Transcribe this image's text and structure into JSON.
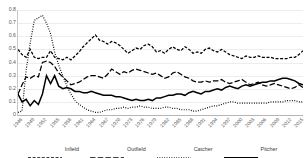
{
  "chart_data": {
    "type": "line",
    "title": "",
    "xlabel": "",
    "ylabel": "",
    "ylim": [
      0,
      0.8
    ],
    "ytick_labels": [
      "0.8",
      "0.7",
      "0.6",
      "0.5",
      "0.4",
      "0.3",
      "0.2",
      "0.1",
      "0"
    ],
    "ytick_values": [
      0.8,
      0.7,
      0.6,
      0.5,
      0.4,
      0.3,
      0.2,
      0.1,
      0
    ],
    "grid": true,
    "legend_position": "bottom",
    "x_start_year": 1946,
    "x_end_year": 2016,
    "xtick_step_years": 3,
    "xtick_labels": [
      "1946",
      "1949",
      "1952",
      "1955",
      "1958",
      "1961",
      "1964",
      "1967",
      "1970",
      "1973",
      "1976",
      "1979",
      "1982",
      "1985",
      "1988",
      "1991",
      "1994",
      "1997",
      "2000",
      "2003",
      "2006",
      "2009",
      "2012",
      "2015"
    ],
    "x": [
      1946,
      1947,
      1948,
      1949,
      1950,
      1951,
      1952,
      1953,
      1954,
      1955,
      1956,
      1957,
      1958,
      1959,
      1960,
      1961,
      1962,
      1963,
      1964,
      1965,
      1966,
      1967,
      1968,
      1969,
      1970,
      1971,
      1972,
      1973,
      1974,
      1975,
      1976,
      1977,
      1978,
      1979,
      1980,
      1981,
      1982,
      1983,
      1984,
      1985,
      1986,
      1987,
      1988,
      1989,
      1990,
      1991,
      1992,
      1993,
      1994,
      1995,
      1996,
      1997,
      1998,
      1999,
      2000,
      2001,
      2002,
      2003,
      2004,
      2005,
      2006,
      2007,
      2008,
      2009,
      2010,
      2011,
      2012,
      2013,
      2014,
      2015,
      2016
    ],
    "series": [
      {
        "name": "Infield",
        "style": "medium-dash",
        "color": "#000000",
        "values": [
          0.5,
          0.46,
          0.44,
          0.5,
          0.44,
          0.43,
          0.44,
          0.44,
          0.49,
          0.44,
          0.43,
          0.42,
          0.44,
          0.42,
          0.45,
          0.48,
          0.52,
          0.55,
          0.58,
          0.61,
          0.57,
          0.56,
          0.54,
          0.56,
          0.55,
          0.53,
          0.5,
          0.47,
          0.49,
          0.51,
          0.5,
          0.53,
          0.54,
          0.52,
          0.48,
          0.49,
          0.47,
          0.5,
          0.52,
          0.5,
          0.49,
          0.52,
          0.5,
          0.47,
          0.48,
          0.47,
          0.5,
          0.51,
          0.49,
          0.48,
          0.5,
          0.48,
          0.46,
          0.45,
          0.44,
          0.43,
          0.45,
          0.44,
          0.44,
          0.45,
          0.44,
          0.44,
          0.44,
          0.43,
          0.43,
          0.43,
          0.43,
          0.44,
          0.44,
          0.46,
          0.49
        ]
      },
      {
        "name": "Outfield",
        "style": "long-dash",
        "color": "#000000",
        "values": [
          0.16,
          0.23,
          0.29,
          0.28,
          0.3,
          0.29,
          0.4,
          0.41,
          0.4,
          0.37,
          0.32,
          0.29,
          0.26,
          0.23,
          0.24,
          0.25,
          0.27,
          0.29,
          0.3,
          0.3,
          0.29,
          0.28,
          0.31,
          0.35,
          0.33,
          0.31,
          0.33,
          0.32,
          0.34,
          0.35,
          0.34,
          0.33,
          0.32,
          0.31,
          0.32,
          0.3,
          0.28,
          0.29,
          0.32,
          0.33,
          0.31,
          0.29,
          0.28,
          0.26,
          0.25,
          0.25,
          0.26,
          0.25,
          0.26,
          0.26,
          0.27,
          0.25,
          0.24,
          0.25,
          0.26,
          0.27,
          0.25,
          0.23,
          0.24,
          0.25,
          0.23,
          0.22,
          0.23,
          0.24,
          0.23,
          0.22,
          0.21,
          0.2,
          0.21,
          0.23,
          0.21
        ]
      },
      {
        "name": "Catcher",
        "style": "dotted",
        "color": "#000000",
        "values": [
          0.02,
          0.03,
          0.34,
          0.55,
          0.72,
          0.74,
          0.76,
          0.7,
          0.62,
          0.48,
          0.38,
          0.3,
          0.22,
          0.16,
          0.11,
          0.08,
          0.06,
          0.04,
          0.03,
          0.02,
          0.02,
          0.03,
          0.04,
          0.04,
          0.05,
          0.05,
          0.06,
          0.05,
          0.06,
          0.06,
          0.07,
          0.06,
          0.06,
          0.05,
          0.05,
          0.05,
          0.06,
          0.06,
          0.05,
          0.05,
          0.04,
          0.04,
          0.04,
          0.03,
          0.03,
          0.04,
          0.05,
          0.06,
          0.07,
          0.07,
          0.08,
          0.09,
          0.1,
          0.1,
          0.09,
          0.09,
          0.09,
          0.09,
          0.09,
          0.09,
          0.09,
          0.09,
          0.1,
          0.1,
          0.1,
          0.1,
          0.11,
          0.11,
          0.11,
          0.1,
          0.1
        ]
      },
      {
        "name": "Pitcher",
        "style": "solid",
        "color": "#000000",
        "values": [
          0.16,
          0.1,
          0.12,
          0.07,
          0.11,
          0.08,
          0.16,
          0.3,
          0.24,
          0.3,
          0.22,
          0.2,
          0.21,
          0.2,
          0.18,
          0.18,
          0.17,
          0.17,
          0.18,
          0.17,
          0.16,
          0.15,
          0.15,
          0.15,
          0.14,
          0.14,
          0.13,
          0.12,
          0.11,
          0.12,
          0.11,
          0.11,
          0.12,
          0.11,
          0.13,
          0.13,
          0.14,
          0.15,
          0.15,
          0.16,
          0.16,
          0.15,
          0.17,
          0.18,
          0.17,
          0.16,
          0.18,
          0.18,
          0.19,
          0.2,
          0.19,
          0.21,
          0.22,
          0.21,
          0.2,
          0.22,
          0.23,
          0.22,
          0.23,
          0.24,
          0.25,
          0.25,
          0.26,
          0.26,
          0.27,
          0.28,
          0.28,
          0.27,
          0.26,
          0.24,
          0.23
        ]
      }
    ]
  }
}
